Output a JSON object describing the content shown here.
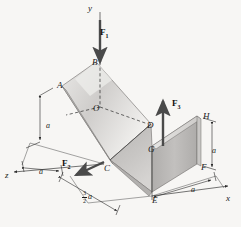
{
  "figure": {
    "type": "engineering-mechanics-free-body-diagram",
    "background_color": "#f7f6f4",
    "line_color": "#1a1a1a"
  },
  "axes": [
    {
      "id": "y",
      "label": "y",
      "direction": "up",
      "x": 88,
      "y": 4
    },
    {
      "id": "x",
      "label": "x",
      "direction": "right-down",
      "x": 226,
      "y": 194
    },
    {
      "id": "z",
      "label": "z",
      "direction": "left-down",
      "x": 5,
      "y": 171
    }
  ],
  "points": [
    {
      "id": "A",
      "label": "A",
      "x": 57,
      "y": 81
    },
    {
      "id": "B",
      "label": "B",
      "x": 92,
      "y": 58
    },
    {
      "id": "O",
      "label": "O",
      "x": 93,
      "y": 104
    },
    {
      "id": "C",
      "label": "C",
      "x": 104,
      "y": 164
    },
    {
      "id": "D",
      "label": "D",
      "x": 147,
      "y": 121
    },
    {
      "id": "E",
      "label": "E",
      "x": 152,
      "y": 196
    },
    {
      "id": "F",
      "label": "F",
      "x": 201,
      "y": 163
    },
    {
      "id": "G",
      "label": "G",
      "x": 148,
      "y": 145
    },
    {
      "id": "H",
      "label": "H",
      "x": 203,
      "y": 112
    }
  ],
  "forces": [
    {
      "id": "F1",
      "label": "F",
      "subscript": "1",
      "direction": "downward along y-axis onto B",
      "x": 100,
      "y": 28
    },
    {
      "id": "F2",
      "label": "F",
      "subscript": "2",
      "direction": "down-left from C",
      "x": 62,
      "y": 159
    },
    {
      "id": "F3",
      "label": "F",
      "subscript": "3",
      "direction": "upward from G",
      "x": 172,
      "y": 99
    }
  ],
  "dimensions": [
    {
      "id": "dim-a-left",
      "label": "a",
      "orientation": "vertical",
      "x": 46,
      "y": 122
    },
    {
      "id": "dim-a-z",
      "label": "a",
      "orientation": "along-z",
      "x": 39,
      "y": 168
    },
    {
      "id": "dim-a-right",
      "label": "a",
      "orientation": "vertical",
      "x": 212,
      "y": 147
    },
    {
      "id": "dim-a-x",
      "label": "a",
      "orientation": "along-x",
      "x": 191,
      "y": 186
    },
    {
      "id": "dim-three-halves-a",
      "numerator": "3",
      "denominator": "2",
      "variable": "a",
      "orientation": "along-z",
      "x": 82,
      "y": 190
    }
  ],
  "surfaces": [
    {
      "id": "tilted-plate",
      "vertices": "A-B-D-C",
      "shade": "light"
    },
    {
      "id": "horizontal-plate",
      "vertices": "C-D-G-E",
      "shade": "medium"
    },
    {
      "id": "vertical-plate",
      "vertices": "G-H-F-E",
      "shade": "medium-dark"
    }
  ]
}
